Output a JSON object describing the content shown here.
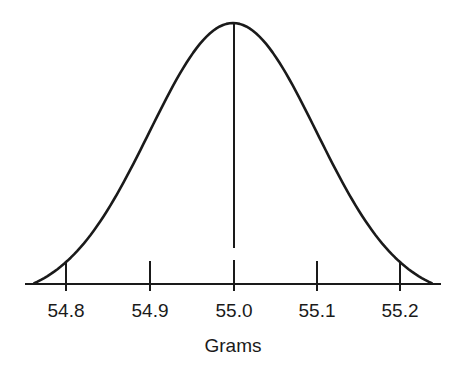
{
  "chart_data": {
    "type": "line",
    "subtype": "normal-distribution-curve",
    "title": "",
    "xlabel": "Grams",
    "ylabel": "",
    "mean": 55.0,
    "std_dev_estimate": 0.1,
    "x_ticks": [
      54.8,
      54.9,
      55.0,
      55.1,
      55.2
    ],
    "tick_labels": [
      "54.8",
      "54.9",
      "55.0",
      "55.1",
      "55.2"
    ],
    "xlim": [
      54.75,
      55.25
    ],
    "ylim": [
      0,
      1
    ],
    "grid": false,
    "legend": null,
    "annotations": [
      "vertical line at mean 55.0"
    ],
    "series": [
      {
        "name": "distribution",
        "x": [
          54.76,
          54.8,
          54.85,
          54.9,
          54.95,
          55.0,
          55.05,
          55.1,
          55.15,
          55.2,
          55.24
        ],
        "y": [
          0.0,
          0.14,
          0.32,
          0.61,
          0.88,
          1.0,
          0.88,
          0.61,
          0.32,
          0.14,
          0.0
        ]
      }
    ]
  },
  "axis": {
    "title": "Grams",
    "ticks": [
      {
        "label": "54.8"
      },
      {
        "label": "54.9"
      },
      {
        "label": "55.0"
      },
      {
        "label": "55.1"
      },
      {
        "label": "55.2"
      }
    ]
  },
  "colors": {
    "line": "#1a1a1a",
    "background": "#ffffff"
  }
}
